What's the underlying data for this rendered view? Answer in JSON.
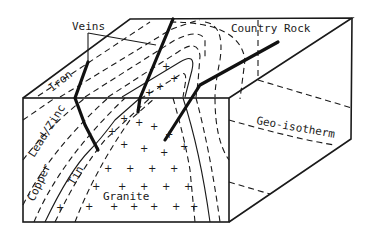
{
  "diagram": {
    "labels": {
      "veins": "Veins",
      "country_rock": "Country Rock",
      "geo_isotherm": "Geo-isotherm",
      "iron": "Iron",
      "lead_zinc": "Lead/Zinc",
      "copper": "Copper",
      "tin": "Tin",
      "granite": "Granite"
    },
    "zones_outer_to_inner": [
      "Country Rock",
      "Iron",
      "Lead/Zinc",
      "Copper",
      "Tin",
      "Granite"
    ],
    "colors": {
      "ink": "#1a1a1a",
      "paper": "#ffffff"
    }
  }
}
